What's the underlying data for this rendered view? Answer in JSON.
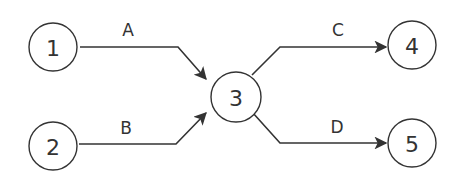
{
  "diagram": {
    "type": "network-flow",
    "nodes": [
      {
        "id": "1",
        "label": "1"
      },
      {
        "id": "2",
        "label": "2"
      },
      {
        "id": "3",
        "label": "3"
      },
      {
        "id": "4",
        "label": "4"
      },
      {
        "id": "5",
        "label": "5"
      }
    ],
    "edges": [
      {
        "from": "1",
        "to": "3",
        "label": "A"
      },
      {
        "from": "2",
        "to": "3",
        "label": "B"
      },
      {
        "from": "3",
        "to": "4",
        "label": "C"
      },
      {
        "from": "3",
        "to": "5",
        "label": "D"
      }
    ],
    "colors": {
      "stroke": "#333333",
      "background": "#ffffff"
    }
  }
}
